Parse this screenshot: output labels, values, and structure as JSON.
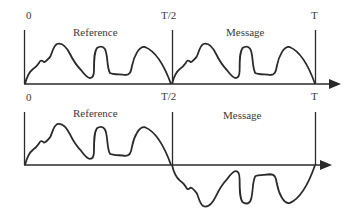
{
  "figure": {
    "top_panel": {
      "tick_labels_top": [
        "0",
        "T/2",
        "T"
      ],
      "tick_labels_bottom": [
        "0",
        "T/2",
        "T"
      ],
      "segments": [
        "Reference",
        "Message"
      ],
      "description": "Message segment is an identical copy of reference waveform"
    },
    "bottom_panel": {
      "segments": [
        "Reference",
        "Message"
      ],
      "description": "Message segment is an inverted copy of reference waveform"
    },
    "colors": {
      "line": "#2a2a2a",
      "text": "#3a3a3a",
      "background": "#ffffff"
    }
  }
}
